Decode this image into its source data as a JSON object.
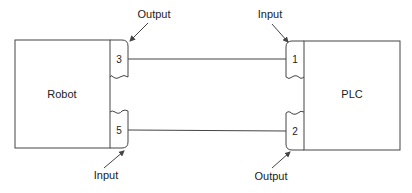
{
  "diagram": {
    "robot": {
      "label": "Robot"
    },
    "plc": {
      "label": "PLC"
    },
    "robot_terminals": [
      {
        "number": "3",
        "role": "Output"
      },
      {
        "number": "5",
        "role": "Input"
      }
    ],
    "plc_terminals": [
      {
        "number": "1",
        "role": "Input"
      },
      {
        "number": "2",
        "role": "Output"
      }
    ],
    "connections": [
      {
        "from": "Robot 3",
        "to": "PLC 1"
      },
      {
        "from": "Robot 5",
        "to": "PLC 2"
      }
    ],
    "callouts": {
      "robot_top": "Output",
      "robot_bottom": "Input",
      "plc_top": "Input",
      "plc_bottom": "Output"
    },
    "colors": {
      "line": "#444444",
      "text": "#222222",
      "background": "#ffffff"
    }
  }
}
